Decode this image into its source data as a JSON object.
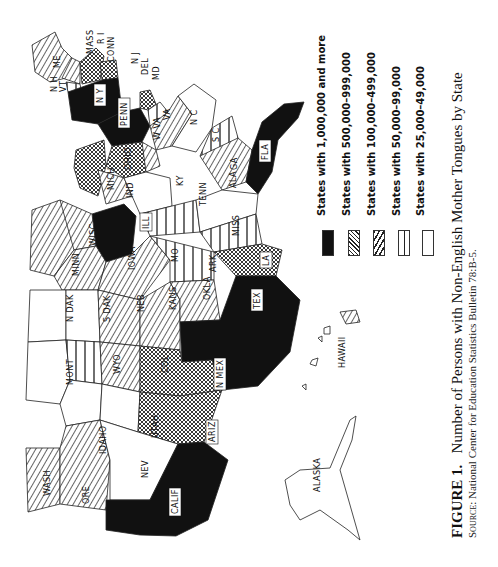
{
  "figure": {
    "label": "FIGURE 1.",
    "title": "Number of Persons with Non-English Mother Tongues by State",
    "source_label": "Source:",
    "source_text": "National Center for Education Statistics Bulletin 78:B-5."
  },
  "legend": {
    "items": [
      {
        "label": "States with 1,000,000 and more",
        "pattern": "solid-black"
      },
      {
        "label": "States with 500,000–999,000",
        "pattern": "crosshatch"
      },
      {
        "label": "States with 100,000–499,000",
        "pattern": "diagonal-hatch"
      },
      {
        "label": "States with 50,000–99,000",
        "pattern": "vertical-lines"
      },
      {
        "label": "States with 25,000–49,000",
        "pattern": "blank"
      }
    ]
  },
  "map": {
    "orientation": "rotated 90° counter-clockwise",
    "states": {
      "1000000_plus": [
        "N Y",
        "PENN",
        "FLA",
        "ILL",
        "TEX",
        "CALIF"
      ],
      "500000_999000": [
        "MASS",
        "CONN",
        "N J",
        "OHIO",
        "MICH",
        "LA",
        "N MEX",
        "ARIZ"
      ],
      "100000_499000": [
        "ME",
        "N H",
        "R I",
        "MD",
        "VA",
        "W VA",
        "GA",
        "IND",
        "WISC",
        "MINN",
        "IOWA",
        "MO",
        "KANS",
        "NEB",
        "OKLA",
        "ARK",
        "COL",
        "WASH",
        "ORE",
        "HAWAII"
      ],
      "50000_99000": [
        "VT",
        "DEL",
        "S C",
        "TENN",
        "MISS",
        "WYO"
      ],
      "25000_49000": [
        "N C",
        "KY",
        "ALA",
        "N DAK",
        "S DAK",
        "MONT",
        "IDAHO",
        "UTAH",
        "NEV",
        "ALASKA"
      ]
    },
    "labels": {
      "me": "ME",
      "nh": "N H",
      "vt": "VT",
      "mass": "MASS",
      "ri": "R I",
      "conn": "CONN",
      "nj": "N J",
      "del": "DEL",
      "md": "MD",
      "ny": "N Y",
      "penn": "PENN",
      "va": "VA",
      "wva": "W VA",
      "nc": "N C",
      "sc": "S C",
      "fla": "FLA",
      "ga": "GA",
      "ohio": "OHIO",
      "mich": "MICH",
      "ind": "IND",
      "ky": "KY",
      "tenn": "TENN",
      "ala": "ALA",
      "ill": "ILL",
      "wisc": "WISC",
      "minn": "MINN",
      "iowa": "IOWA",
      "mo": "MO",
      "ark": "ARK",
      "miss": "MISS",
      "la": "LA",
      "ndak": "N DAK",
      "sdak": "S DAK",
      "neb": "NEB",
      "kans": "KANS",
      "okla": "OKLA",
      "tex": "TEX",
      "mont": "MONT",
      "wyo": "WYO",
      "col": "COL",
      "nmex": "N MEX",
      "idaho": "IDAHO",
      "utah": "UTAH",
      "ariz": "ARIZ",
      "wash": "WASH",
      "ore": "ORE",
      "nev": "NEV",
      "calif": "CALIF",
      "hawaii": "HAWAII",
      "alaska": "ALASKA"
    }
  }
}
